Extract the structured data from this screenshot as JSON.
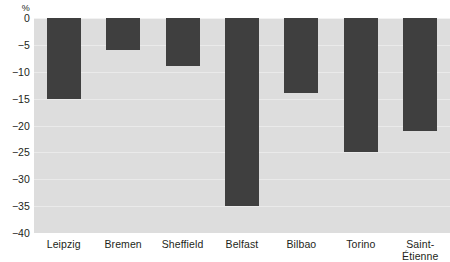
{
  "chart_data": {
    "type": "bar",
    "title": "",
    "subtitle": "",
    "xlabel": "",
    "ylabel": "%",
    "unit_label": "%",
    "categories": [
      "Leipzig",
      "Bremen",
      "Sheffield",
      "Belfast",
      "Bilbao",
      "Torino",
      "Saint-Étienne"
    ],
    "values": [
      -15,
      -6,
      -9,
      -35,
      -14,
      -25,
      -21
    ],
    "ylim": [
      -40,
      0
    ],
    "ytick_labels": [
      "0",
      "−5",
      "−10",
      "−15",
      "−20",
      "−25",
      "−30",
      "−35",
      "−40"
    ],
    "ytick_values": [
      0,
      -5,
      -10,
      -15,
      -20,
      -25,
      -30,
      -35,
      -40
    ],
    "grid": true,
    "legend": "none",
    "orientation": "vertical",
    "bar_color": "#3f3f3f",
    "plot_background": "#dddddd",
    "gridline_color": "#eaeaea",
    "page_background": "#ffffff"
  }
}
